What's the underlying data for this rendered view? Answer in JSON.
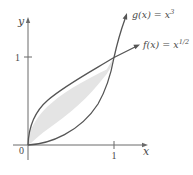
{
  "figure": {
    "axes": {
      "x_label": "x",
      "y_label": "y",
      "origin_label": "0",
      "x_tick_label": "1",
      "y_tick_label": "1"
    },
    "curves": [
      {
        "id": "g",
        "label_name": "g(x) = x",
        "label_exponent": "3",
        "function": "x^3"
      },
      {
        "id": "f",
        "label_name": "f(x) = x",
        "label_exponent": "1/2",
        "function": "x^(1/2)"
      }
    ],
    "shaded_region": {
      "description": "Region between f(x)=x^(1/2) and g(x)=x^3 from x=0 to x=1",
      "x_range": [
        0,
        1
      ]
    },
    "colors": {
      "axis": "#6a6a6a",
      "curve": "#555555",
      "fill": "#e4e4e4",
      "text": "#4a4a4a"
    }
  }
}
